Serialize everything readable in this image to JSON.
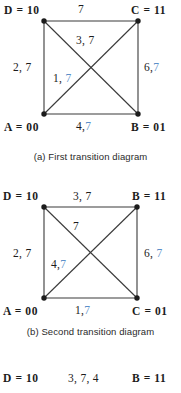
{
  "figures": [
    {
      "id": "first-transition-diagram",
      "caption": "(a) First transition diagram",
      "nodes": {
        "top_left": "D = 10",
        "top_right": "C = 11",
        "bottom_left": "A = 00",
        "bottom_right": "B = 01"
      },
      "edges": {
        "top": {
          "black": "7",
          "blue": ""
        },
        "left": {
          "black": "2, 7",
          "blue": ""
        },
        "right": {
          "black": "6,",
          "blue": "7"
        },
        "bottom": {
          "black": "4,",
          "blue": "7"
        },
        "diag_tl_br": {
          "black": "3, 7",
          "blue": ""
        },
        "diag_bl_tr": {
          "black": "1,",
          "blue": "7"
        }
      }
    },
    {
      "id": "second-transition-diagram",
      "caption": "(b) Second transition diagram",
      "nodes": {
        "top_left": "D = 10",
        "top_right": "B = 11",
        "bottom_left": "A = 00",
        "bottom_right": "C = 01"
      },
      "edges": {
        "top": {
          "black": "3, 7",
          "blue": ""
        },
        "left": {
          "black": "2, 7",
          "blue": ""
        },
        "right": {
          "black": "6,",
          "blue": "7"
        },
        "bottom": {
          "black": "1,",
          "blue": "7"
        },
        "diag_tl_br": {
          "black": "7",
          "blue": ""
        },
        "diag_bl_tr": {
          "black": "4,",
          "blue": "7"
        }
      }
    },
    {
      "id": "third-transition-diagram",
      "caption": "",
      "nodes": {
        "top_left": "D = 10",
        "top_right": "B = 11",
        "bottom_left": "",
        "bottom_right": ""
      },
      "edges": {
        "top": {
          "black": "3, 7, 4",
          "blue": ""
        },
        "left": {
          "black": "",
          "blue": ""
        },
        "right": {
          "black": "",
          "blue": ""
        },
        "bottom": {
          "black": "",
          "blue": ""
        },
        "diag_tl_br": {
          "black": "",
          "blue": ""
        },
        "diag_bl_tr": {
          "black": "",
          "blue": ""
        }
      }
    }
  ],
  "colors": {
    "ink": "#1c1c1c",
    "accent_blue": "#5b8fc9",
    "edge_line": "#3a3a3a",
    "background": "#ffffff"
  }
}
